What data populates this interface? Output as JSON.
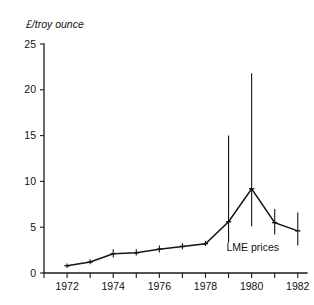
{
  "chart_data": {
    "type": "line",
    "title": "",
    "subtitle": "",
    "xlabel": "",
    "ylabel": "£/troy ounce",
    "xlim": [
      1971,
      1982.4
    ],
    "ylim": [
      0,
      25
    ],
    "grid": false,
    "legend_position": "none",
    "x": [
      1972,
      1973,
      1974,
      1975,
      1976,
      1977,
      1978,
      1979,
      1980,
      1981,
      1982
    ],
    "series": [
      {
        "name": "LME prices",
        "values": [
          0.8,
          1.2,
          2.1,
          2.2,
          2.6,
          2.9,
          3.2,
          5.6,
          9.2,
          5.5,
          4.6
        ],
        "error_low": [
          0.55,
          0.95,
          1.7,
          1.9,
          2.25,
          2.6,
          2.95,
          3.3,
          5.1,
          4.2,
          3.0
        ],
        "error_high": [
          1.05,
          1.5,
          2.6,
          2.6,
          3.0,
          3.25,
          3.5,
          15.0,
          21.8,
          7.0,
          6.6
        ]
      }
    ],
    "yticks": [
      0,
      5,
      10,
      15,
      20,
      25
    ],
    "ytick_labels": [
      "0",
      "5",
      "10",
      "15",
      "20",
      "25"
    ],
    "xticks": [
      1971,
      1972,
      1973,
      1974,
      1975,
      1976,
      1977,
      1978,
      1979,
      1980,
      1981,
      1982
    ],
    "xtick_labels": [
      "",
      "1972",
      "",
      "1974",
      "",
      "1976",
      "",
      "1978",
      "",
      "1980",
      "",
      "1982"
    ],
    "annotations": [
      {
        "text": "LME prices",
        "x": 1980.05,
        "y": 2.45
      }
    ],
    "colors": {
      "line": "#141414",
      "axis": "#1a1a1a",
      "text": "#111111",
      "background": "#ffffff"
    }
  }
}
